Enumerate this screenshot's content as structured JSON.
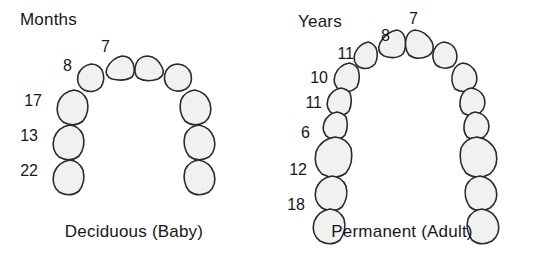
{
  "figure": {
    "type": "dental-arch-diagram",
    "background_color": "#ffffff",
    "tooth_fill_color": "#f1f1ef",
    "tooth_outline_color": "#2b2b2b",
    "text_color": "#17171a"
  },
  "panels": [
    {
      "id": "deciduous",
      "unit_title": "Months",
      "caption": "Deciduous (Baby)",
      "teeth_per_side": 5,
      "total_teeth": 10,
      "age_labels": [
        {
          "value": "7",
          "tooth": "central-incisor"
        },
        {
          "value": "8",
          "tooth": "lateral-incisor"
        },
        {
          "value": "17",
          "tooth": "canine"
        },
        {
          "value": "13",
          "tooth": "first-molar"
        },
        {
          "value": "22",
          "tooth": "second-molar"
        }
      ]
    },
    {
      "id": "permanent",
      "unit_title": "Years",
      "caption": "Permanent (Adult)",
      "teeth_per_side": 7,
      "total_teeth": 14,
      "age_labels": [
        {
          "value": "7",
          "tooth": "central-incisor"
        },
        {
          "value": "8",
          "tooth": "lateral-incisor"
        },
        {
          "value": "11",
          "tooth": "canine"
        },
        {
          "value": "10",
          "tooth": "first-premolar"
        },
        {
          "value": "11",
          "tooth": "second-premolar"
        },
        {
          "value": "6",
          "tooth": "first-molar"
        },
        {
          "value": "12",
          "tooth": "second-molar"
        },
        {
          "value": "18",
          "tooth": "third-molar"
        }
      ]
    }
  ]
}
